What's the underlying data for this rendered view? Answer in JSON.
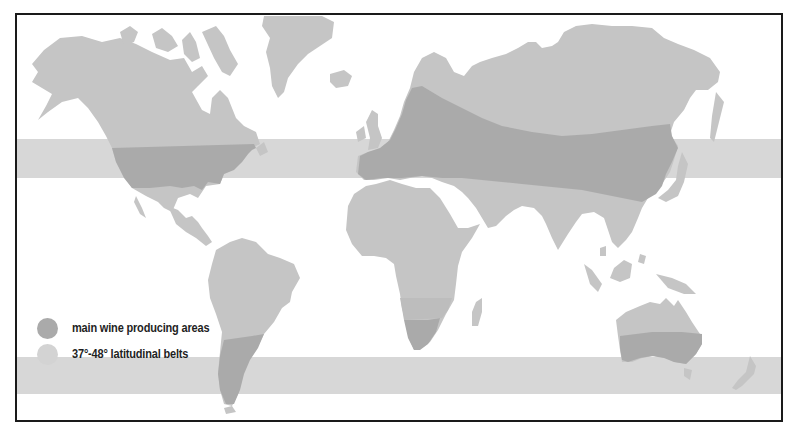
{
  "map": {
    "title": "",
    "type": "world wine producing regions map",
    "colors": {
      "land": "#c5c5c5",
      "wine_area": "#aaaaaa",
      "belt": "#d7d7d7",
      "belt_overlap_land": "#bdbdbd",
      "border": "#1a1a1a",
      "background": "#ffffff"
    },
    "belts": [
      {
        "name": "northern-belt",
        "label": "37°-48° N"
      },
      {
        "name": "southern-belt",
        "label": "37°-48° S"
      }
    ]
  },
  "legend": {
    "items": [
      {
        "label": "main wine producing areas",
        "color": "#aaaaaa"
      },
      {
        "label": "37°-48° latitudinal belts",
        "color": "#d3d3d3"
      }
    ]
  }
}
